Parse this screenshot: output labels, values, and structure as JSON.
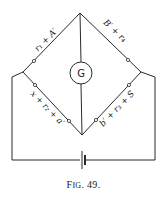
{
  "figure": {
    "caption_prefix": "F",
    "caption_smallcaps": "IG",
    "caption_suffix": ". 49."
  },
  "bridge": {
    "galvanometer_label": "G",
    "arms": [
      {
        "position": "top-left",
        "label": "r₁ + A′"
      },
      {
        "position": "top-right",
        "label": "B′ + r₄"
      },
      {
        "position": "bottom-left",
        "label": "x + r₂ + a′"
      },
      {
        "position": "bottom-right",
        "label": "b′ + r₃ + S"
      }
    ]
  },
  "colors": {
    "line": "#2a2a2a",
    "background": "#ffffff"
  }
}
